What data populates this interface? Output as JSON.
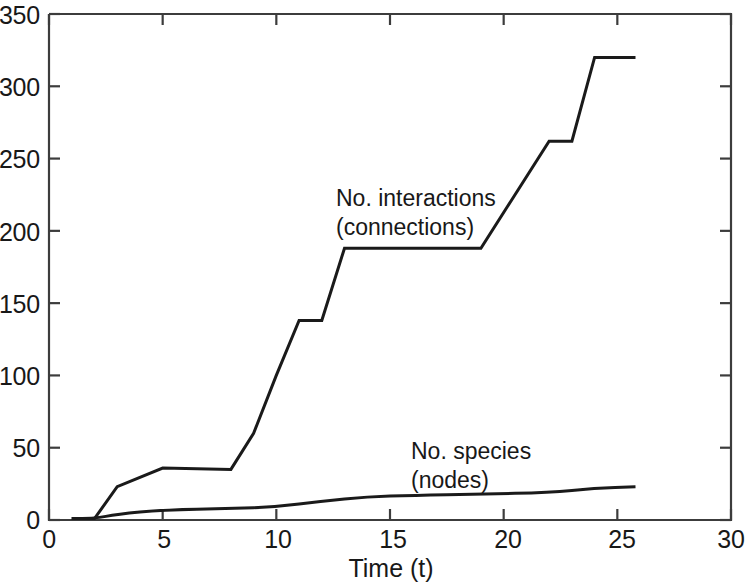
{
  "chart_data": {
    "type": "line",
    "title": "",
    "subtitle": "",
    "xlabel": "Time (t)",
    "ylabel": "",
    "xlim": [
      0,
      30
    ],
    "ylim": [
      0,
      350
    ],
    "xticks": [
      0,
      5,
      10,
      15,
      20,
      25,
      30
    ],
    "yticks": [
      0,
      50,
      100,
      150,
      200,
      250,
      300,
      350
    ],
    "xtick_labels": [
      "0",
      "5",
      "10",
      "15",
      "20",
      "25",
      "30"
    ],
    "ytick_labels": [
      "0",
      "50",
      "100",
      "150",
      "200",
      "250",
      "300",
      "350"
    ],
    "grid": false,
    "legend_position": "inline-annotations",
    "line_color": "#1a1a1a",
    "line_width": 3,
    "background_color": "#ffffff",
    "axis_color": "#3c3c3c",
    "series": [
      {
        "name": "No. interactions (connections)",
        "style": "step",
        "x": [
          1.0,
          2.0,
          3.0,
          5.0,
          8.0,
          9.0,
          10.0,
          11.0,
          12.0,
          13.0,
          19.0,
          22.0,
          23.0,
          24.0,
          25.8
        ],
        "values": [
          1,
          1,
          23,
          36,
          35,
          60,
          100,
          138,
          138,
          188,
          188,
          262,
          262,
          320,
          320
        ]
      },
      {
        "name": "No. species (nodes)",
        "style": "smooth",
        "x": [
          1.0,
          2.0,
          3.0,
          5.0,
          8.0,
          10.0,
          12.0,
          14.0,
          16.0,
          19.0,
          22.0,
          24.0,
          25.8
        ],
        "values": [
          1,
          1,
          4,
          7,
          8,
          9,
          13,
          16,
          17,
          18,
          19,
          22,
          23
        ]
      }
    ],
    "annotations": [
      {
        "name": "interactions-label",
        "lines": [
          "No. interactions",
          "(connections)"
        ],
        "x_data": 13.2,
        "y_data": 212
      },
      {
        "name": "species-label",
        "lines": [
          "No. species",
          "(nodes)"
        ],
        "x_data": 18.0,
        "y_data": 58
      }
    ]
  }
}
